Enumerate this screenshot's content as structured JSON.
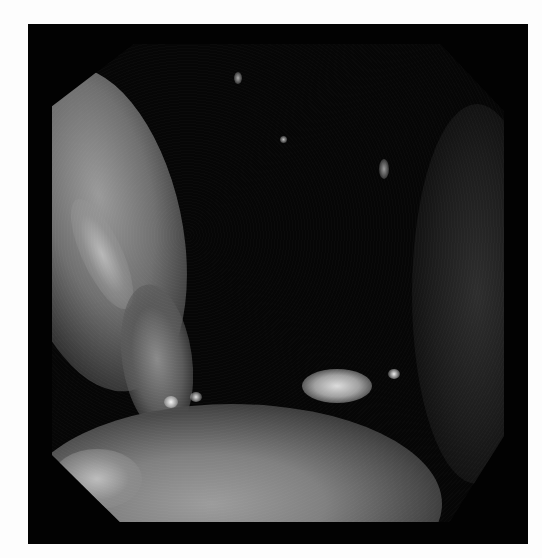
{
  "image": {
    "description": "Grayscale endoscopic view of a lumen, octagonal field of view on a black frame",
    "colors": {
      "frame": "#020202",
      "background": "#fdfdfd",
      "mucosa_light": "#a8a8a8",
      "lumen_dark": "#050505"
    }
  }
}
